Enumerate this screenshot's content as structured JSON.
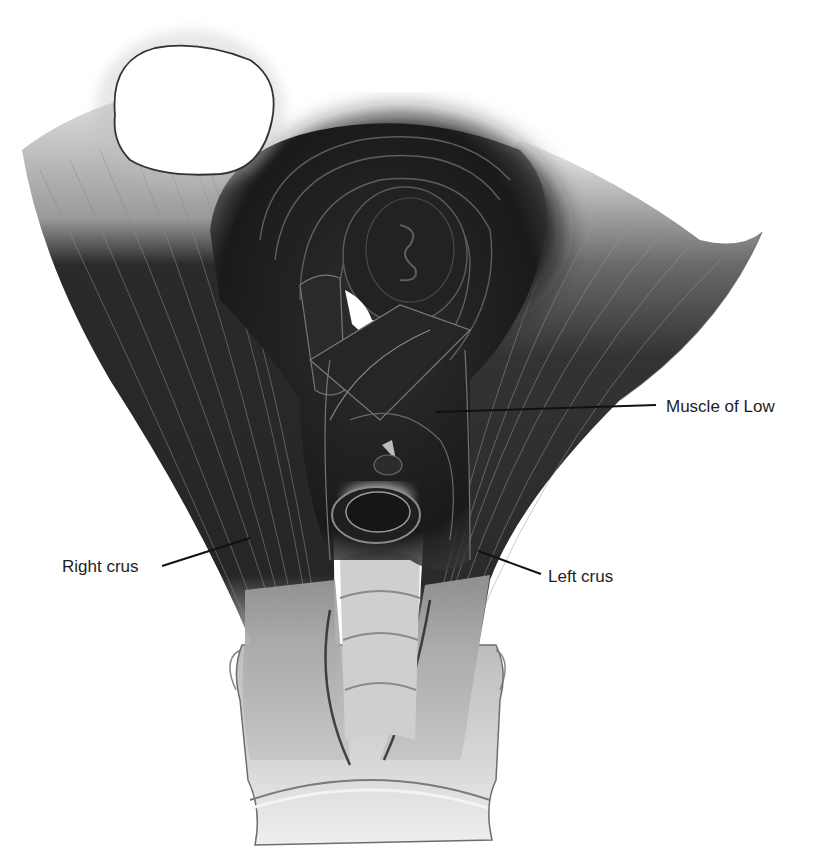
{
  "figure": {
    "labels": [
      {
        "id": "muscle-of-low",
        "text": "Muscle of Low",
        "x": 666,
        "y": 397,
        "line": {
          "x1": 436,
          "y1": 412,
          "x2": 656,
          "y2": 405
        }
      },
      {
        "id": "right-crus",
        "text": "Right crus",
        "x": 62,
        "y": 557,
        "line": {
          "x1": 162,
          "y1": 566,
          "x2": 250,
          "y2": 538
        }
      },
      {
        "id": "left-crus",
        "text": "Left crus",
        "x": 548,
        "y": 567,
        "line": {
          "x1": 478,
          "y1": 551,
          "x2": 541,
          "y2": 574
        }
      }
    ],
    "colors": {
      "background": "#ffffff",
      "muscle_dark": "#1c1c1c",
      "muscle_mid": "#4a4a4a",
      "tendon_light": "#bdbdbd",
      "vertebra": "#d4d4d4",
      "outline": "#2a2a2a",
      "label_text": "#1e1e1e"
    }
  }
}
